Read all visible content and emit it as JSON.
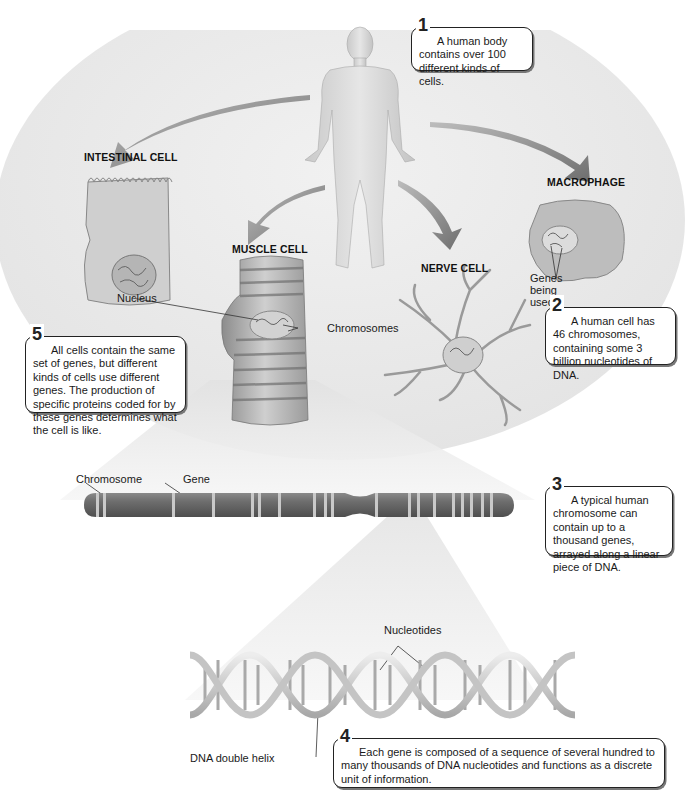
{
  "figure": {
    "headings": {
      "intestinal_cell": "INTESTINAL CELL",
      "muscle_cell": "MUSCLE CELL",
      "nerve_cell": "NERVE CELL",
      "macrophage": "MACROPHAGE"
    },
    "labels": {
      "nucleus": "Nucleus",
      "chromosomes": "Chromosomes",
      "genes_being_used": [
        "Genes",
        "being",
        "used"
      ],
      "chromosome": "Chromosome",
      "gene": "Gene",
      "nucleotides": "Nucleotides",
      "dna_double_helix": "DNA double helix"
    },
    "callouts": [
      {
        "number": "1",
        "text": "A human body contains over 100 different kinds of cells."
      },
      {
        "number": "2",
        "text": "A human cell has 46 chromosomes, containing some 3 billion nucleotides of DNA."
      },
      {
        "number": "3",
        "text": "A typical human chromosome can contain up to a thousand genes, arrayed along a linear piece of DNA."
      },
      {
        "number": "4",
        "text": "Each gene is composed of a sequence of several hundred to many thousands of DNA nucleotides and functions as a discrete unit of information."
      },
      {
        "number": "5",
        "text": "All cells contain the same set of genes, but different kinds of cells use different genes. The production of specific proteins coded for by these genes determines what the cell is like."
      }
    ],
    "colors": {
      "background_disc": "#ececec",
      "arrow": "#7d7d7d",
      "chromosome": "#6b6b6b",
      "gene_band": "#c9c9c9",
      "callout_border": "#222222"
    }
  }
}
